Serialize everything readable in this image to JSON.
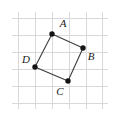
{
  "figure": {
    "kind": "geometry-diagram",
    "canvas": {
      "width": 119,
      "height": 117,
      "background": "#ffffff"
    },
    "grid": {
      "color": "#d9d9dd",
      "line_width": 1,
      "spacing": 17,
      "x_start": 18,
      "y_start": 18,
      "vertical_count": 6,
      "horizontal_count": 6,
      "vertical_x": [
        18,
        35,
        52,
        69,
        86,
        102
      ],
      "horizontal_y": [
        18,
        35,
        52,
        69,
        86,
        103
      ]
    },
    "shape": {
      "name": "ABCD",
      "stroke_color": "#3c3c3c",
      "stroke_width": 1.1,
      "fill": "none",
      "closed": true,
      "edges": [
        "AB",
        "BC",
        "CD",
        "DA"
      ]
    },
    "vertex_marker": {
      "radius": 2.7,
      "fill": "#141414"
    },
    "vertices": [
      {
        "id": "A",
        "label": "A",
        "x": 52,
        "y": 34,
        "label_x": 63,
        "label_y": 24,
        "label_position": "above-right"
      },
      {
        "id": "B",
        "label": "B",
        "x": 83,
        "y": 48,
        "label_x": 91,
        "label_y": 57,
        "label_position": "right-below"
      },
      {
        "id": "C",
        "label": "C",
        "x": 68,
        "y": 81,
        "label_x": 60,
        "label_y": 92,
        "label_position": "below-left"
      },
      {
        "id": "D",
        "label": "D",
        "x": 35,
        "y": 67,
        "label_x": 26,
        "label_y": 60,
        "label_position": "left-above"
      }
    ]
  }
}
